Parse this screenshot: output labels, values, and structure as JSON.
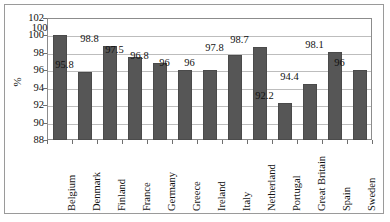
{
  "chart_data": {
    "type": "bar",
    "title": "",
    "xlabel": "",
    "ylabel": "%",
    "ylim": [
      88,
      102
    ],
    "yticks": [
      88,
      90,
      92,
      94,
      96,
      98,
      100,
      102
    ],
    "grid": true,
    "legend": "none",
    "categories": [
      "Belgium",
      "Denmark",
      "Finland",
      "France",
      "Germany",
      "Greece",
      "Ireland",
      "Italy",
      "Netherland",
      "Portugal",
      "Great Britain",
      "Spain",
      "Sweden"
    ],
    "values": [
      100,
      95.8,
      98.8,
      97.5,
      96.8,
      96,
      96,
      97.8,
      98.7,
      92.2,
      94.4,
      98.1,
      96
    ],
    "value_labels": [
      "100",
      "95.8",
      "98.8",
      "97.5",
      "96.8",
      "96",
      "96",
      "97.8",
      "98.7",
      "92.2",
      "94.4",
      "98.1",
      "96"
    ],
    "series": [
      {
        "name": "",
        "values": [
          100,
          95.8,
          98.8,
          97.5,
          96.8,
          96,
          96,
          97.8,
          98.7,
          92.2,
          94.4,
          98.1,
          96
        ],
        "color": "#565656"
      }
    ]
  },
  "axis": {
    "y_title": "%",
    "tick_labels": [
      "102",
      "100",
      "98",
      "96",
      "94",
      "92",
      "90",
      "88"
    ]
  },
  "colors": {
    "bar_fill": "#565656",
    "bar_edge": "#4a4a4a",
    "gridline": "#bdbdbd",
    "plot_border": "#8c8c8c",
    "outer_frame": "#9a9a9a",
    "text": "#111111",
    "background": "#ffffff"
  }
}
